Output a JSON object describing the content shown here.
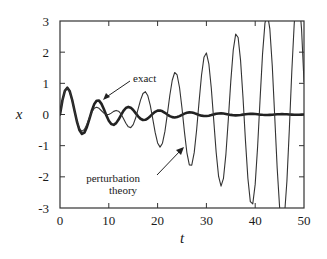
{
  "chart_data": {
    "type": "line",
    "title": "",
    "xlabel": "t",
    "ylabel": "x",
    "xlim": [
      0,
      50
    ],
    "ylim": [
      -3,
      3
    ],
    "xticks": [
      0,
      10,
      20,
      30,
      40,
      50
    ],
    "yticks": [
      -3,
      -2,
      -1,
      0,
      1,
      2,
      3
    ],
    "xtick_labels": [
      "0",
      "10",
      "20",
      "30",
      "40",
      "50"
    ],
    "ytick_labels": [
      "-3",
      "-2",
      "-1",
      "0",
      "1",
      "2",
      "3"
    ],
    "grid": false,
    "legend": "none",
    "x": [
      0,
      0.5,
      1,
      1.5,
      2,
      2.5,
      3,
      3.5,
      4,
      4.5,
      5,
      5.5,
      6,
      6.5,
      7,
      7.5,
      8,
      8.5,
      9,
      9.5,
      10,
      10.5,
      11,
      11.5,
      12,
      12.5,
      13,
      13.5,
      14,
      14.5,
      15,
      15.5,
      16,
      16.5,
      17,
      17.5,
      18,
      18.5,
      19,
      19.5,
      20,
      20.5,
      21,
      21.5,
      22,
      22.5,
      23,
      23.5,
      24,
      24.5,
      25,
      25.5,
      26,
      26.5,
      27,
      27.5,
      28,
      28.5,
      29,
      29.5,
      30,
      30.5,
      31,
      31.5,
      32,
      32.5,
      33,
      33.5,
      34,
      34.5,
      35,
      35.5,
      36,
      36.5,
      37,
      37.5,
      38,
      38.5,
      39,
      39.5,
      40,
      40.5,
      41,
      41.5,
      42,
      42.5,
      43,
      43.5,
      44,
      44.5,
      45,
      45.5,
      46,
      46.5,
      47,
      47.5,
      48,
      48.5,
      49,
      49.5,
      50
    ],
    "series": [
      {
        "name": "exact",
        "style": "thick",
        "values": [
          0,
          0.456,
          0.761,
          0.859,
          0.744,
          0.466,
          0.105,
          -0.247,
          -0.507,
          -0.623,
          -0.582,
          -0.407,
          -0.153,
          0.112,
          0.326,
          0.443,
          0.445,
          0.341,
          0.168,
          -0.029,
          -0.2,
          -0.308,
          -0.333,
          -0.277,
          -0.162,
          -0.019,
          0.115,
          0.208,
          0.244,
          0.219,
          0.145,
          0.044,
          -0.058,
          -0.137,
          -0.176,
          -0.17,
          -0.124,
          -0.054,
          0.022,
          0.086,
          0.124,
          0.128,
          0.102,
          0.055,
          -0.001,
          -0.051,
          -0.085,
          -0.095,
          -0.082,
          -0.051,
          -0.011,
          0.028,
          0.057,
          0.069,
          0.064,
          0.045,
          0.016,
          -0.013,
          -0.037,
          -0.049,
          -0.049,
          -0.038,
          -0.018,
          0.004,
          0.022,
          0.034,
          0.037,
          0.031,
          0.018,
          0.002,
          -0.013,
          -0.023,
          -0.027,
          -0.024,
          -0.016,
          -0.005,
          0.007,
          0.015,
          0.019,
          0.019,
          0.014,
          0.006,
          -0.003,
          -0.01,
          -0.014,
          -0.014,
          -0.011,
          -0.006,
          0,
          0.006,
          0.009,
          0.011,
          0.009,
          0.006,
          0.001,
          -0.003,
          -0.006,
          -0.008,
          -0.007,
          -0.005,
          -0.002
        ]
      },
      {
        "name": "perturbation theory",
        "style": "thin",
        "values": [
          0,
          0.455,
          0.757,
          0.848,
          0.727,
          0.449,
          0.099,
          -0.228,
          -0.454,
          -0.538,
          -0.479,
          -0.317,
          -0.112,
          0.075,
          0.197,
          0.235,
          0.198,
          0.12,
          0.041,
          -0.004,
          0,
          0.044,
          0.1,
          0.131,
          0.107,
          0.017,
          -0.126,
          -0.281,
          -0.396,
          -0.421,
          -0.325,
          -0.114,
          0.173,
          0.463,
          0.673,
          0.732,
          0.601,
          0.291,
          -0.135,
          -0.575,
          -0.913,
          -1.047,
          -0.92,
          -0.542,
          0.011,
          0.609,
          1.1,
          1.348,
          1.268,
          0.858,
          0.199,
          -0.557,
          -1.22,
          -1.616,
          -1.626,
          -1.224,
          -0.488,
          0.414,
          1.261,
          1.835,
          1.976,
          1.628,
          0.848,
          -0.181,
          -1.213,
          -1.989,
          -2.3,
          -2.047,
          -1.27,
          -0.141,
          1.071,
          2.063,
          2.579,
          2.469,
          1.737,
          0.544,
          -0.83,
          -2.046,
          -2.795,
          -2.871,
          -2.235,
          -1.018,
          0.492,
          1.929,
          2.933,
          3.237,
          2.745,
          1.554,
          -0.06,
          -1.707,
          -2.978,
          -3.548,
          -3.246,
          -2.132,
          -0.457,
          1.377,
          2.92,
          3.776,
          3.719,
          2.737,
          1.05
        ]
      }
    ],
    "annotations": [
      {
        "text": "exact",
        "points_to": "exact",
        "at_x": 8,
        "at_y": 0.4
      },
      {
        "text_lines": [
          "perturbation",
          "theory"
        ],
        "points_to": "perturbation theory",
        "at_x": 26,
        "at_y": -1.3
      }
    ]
  }
}
